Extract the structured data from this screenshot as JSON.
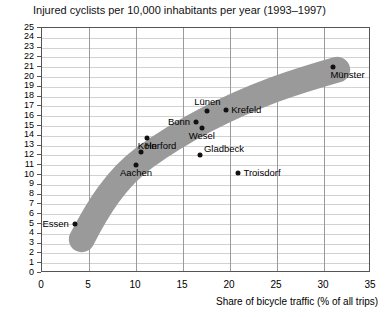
{
  "chart_data": {
    "type": "scatter",
    "title": "Injured cyclists per 10,000 inhabitants per year (1993–1997)",
    "xlabel": "Share of bicycle traffic (% of all trips)",
    "ylabel": "",
    "xlim": [
      0,
      35
    ],
    "ylim": [
      0,
      25
    ],
    "xticks": [
      0,
      5,
      10,
      15,
      20,
      25,
      30,
      35
    ],
    "yticks": [
      0,
      1,
      2,
      3,
      4,
      5,
      6,
      7,
      8,
      9,
      10,
      11,
      12,
      13,
      14,
      15,
      16,
      17,
      18,
      19,
      20,
      21,
      22,
      23,
      24,
      25
    ],
    "grid": true,
    "legend": "none",
    "band": {
      "name": "trend-band",
      "color": "#9a9a9a",
      "description": "Thick grey curved band showing the trend of decreasing injury risk relative to bicycle share"
    },
    "points": [
      {
        "label": "Essen",
        "x": 3.5,
        "y": 5.0,
        "label_side": "left"
      },
      {
        "label": "Aachen",
        "x": 10.0,
        "y": 11.0,
        "label_side": "below"
      },
      {
        "label": "Herford",
        "x": 10.5,
        "y": 12.3,
        "label_side": "right-above"
      },
      {
        "label": "Köln",
        "x": 11.2,
        "y": 13.8,
        "label_side": "below"
      },
      {
        "label": "Gladbeck",
        "x": 16.8,
        "y": 12.0,
        "label_side": "right-above"
      },
      {
        "label": "Wesel",
        "x": 17.0,
        "y": 14.8,
        "label_side": "below"
      },
      {
        "label": "Bonn",
        "x": 16.4,
        "y": 15.4,
        "label_side": "left"
      },
      {
        "label": "Lünen",
        "x": 17.6,
        "y": 16.5,
        "label_side": "above"
      },
      {
        "label": "Krefeld",
        "x": 19.6,
        "y": 16.6,
        "label_side": "right"
      },
      {
        "label": "Troisdorf",
        "x": 20.9,
        "y": 10.2,
        "label_side": "right"
      },
      {
        "label": "Münster",
        "x": 31.0,
        "y": 21.0,
        "label_side": "below-right"
      }
    ]
  }
}
